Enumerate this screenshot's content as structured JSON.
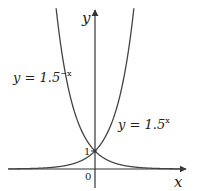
{
  "chart_data": {
    "type": "line",
    "title": "",
    "xlabel": "x",
    "ylabel": "y",
    "series": [
      {
        "name": "y = 1.5^-x",
        "function": "1.5^(-x)",
        "label_base": "y = 1.5",
        "label_exp": "−x"
      },
      {
        "name": "y = 1.5^x",
        "function": "1.5^(x)",
        "label_base": "y = 1.5",
        "label_exp": "x"
      }
    ],
    "annotations": [
      {
        "text": "1",
        "at": [
          0,
          1
        ]
      },
      {
        "text": "0",
        "at": [
          0,
          0
        ]
      }
    ],
    "intersection": [
      0,
      1
    ],
    "xlim": [
      -12,
      12.5
    ],
    "ylim": [
      -1,
      9
    ],
    "grid": false,
    "legend": "none (inline labels)"
  },
  "labels": {
    "y_axis": "y",
    "x_axis": "x",
    "one": "1",
    "origin": "0",
    "left_curve_base": "y = 1.5",
    "left_curve_exp": "−x",
    "right_curve_base": "y = 1.5",
    "right_curve_exp": "x"
  },
  "colors": {
    "axis": "#333333",
    "curve": "#444444",
    "background": "#ffffff"
  }
}
